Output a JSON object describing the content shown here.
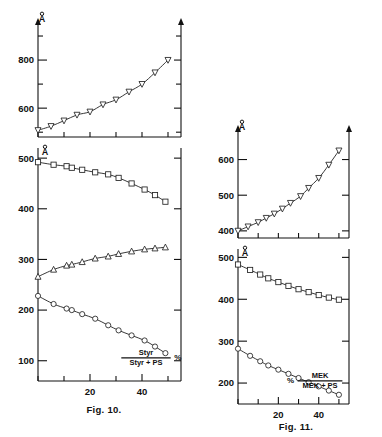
{
  "page": {
    "background": "#ffffff",
    "ink": "#111111"
  },
  "figures": [
    {
      "id": "fig-10",
      "caption": "Fig. 10.",
      "xlabel_numerator": "Styr",
      "xlabel_denominator": "Styr + PS",
      "xlabel_percent": "%",
      "xlabel_percent_side": "right",
      "xaxis_ticks": [
        0,
        10,
        20,
        30,
        40,
        50
      ],
      "xaxis_labeled_ticks": [
        20,
        40
      ],
      "xlim": [
        0,
        55
      ],
      "panels": [
        {
          "id": "fig10-top",
          "ylabel": "Å",
          "yticks": [
            600,
            800
          ],
          "yminor": [
            500,
            700,
            900
          ],
          "ylim": [
            480,
            950
          ]
        },
        {
          "id": "fig10-bottom",
          "ylabel": "Å",
          "yticks": [
            100,
            200,
            300,
            400,
            500
          ],
          "ylim": [
            60,
            520
          ]
        }
      ]
    },
    {
      "id": "fig-11",
      "caption": "Fig. 11.",
      "xlabel_numerator": "MEK",
      "xlabel_denominator": "MEK + PS",
      "xlabel_percent": "%",
      "xlabel_percent_side": "left",
      "xaxis_ticks": [
        0,
        10,
        20,
        30,
        40,
        50
      ],
      "xaxis_labeled_ticks": [
        20,
        40
      ],
      "xlim": [
        0,
        55
      ],
      "panels": [
        {
          "id": "fig11-top",
          "ylabel": "Å",
          "yticks": [
            400,
            500,
            600
          ],
          "ylim": [
            380,
            680
          ]
        },
        {
          "id": "fig11-bottom",
          "ylabel": "Å",
          "yticks": [
            200,
            300,
            400,
            500
          ],
          "ylim": [
            150,
            520
          ]
        }
      ]
    }
  ],
  "chart_data": [
    {
      "id": "fig10-top",
      "type": "scatter",
      "title": "Fig. 10 upper panel",
      "xlabel": "Styr / (Styr + PS)  %",
      "ylabel": "Å",
      "xlim": [
        0,
        55
      ],
      "ylim": [
        480,
        950
      ],
      "grid": false,
      "legend": "none",
      "series": [
        {
          "name": "upper-curve",
          "marker": "triangle-down",
          "x": [
            0,
            5,
            10,
            15,
            20,
            25,
            30,
            35,
            40,
            45,
            50
          ],
          "y": [
            508,
            525,
            548,
            572,
            585,
            615,
            635,
            668,
            700,
            748,
            800
          ]
        }
      ]
    },
    {
      "id": "fig10-bottom",
      "type": "scatter",
      "title": "Fig. 10 lower panel",
      "xlabel": "Styr / (Styr + PS)  %",
      "ylabel": "Å",
      "xlim": [
        0,
        55
      ],
      "ylim": [
        60,
        520
      ],
      "grid": false,
      "legend": "none",
      "series": [
        {
          "name": "square-curve",
          "marker": "square",
          "x": [
            0,
            6,
            11,
            13,
            17,
            22,
            27,
            31,
            36,
            41,
            45,
            49
          ],
          "y": [
            492,
            487,
            484,
            481,
            477,
            472,
            468,
            461,
            450,
            438,
            427,
            414
          ]
        },
        {
          "name": "triangle-curve",
          "marker": "triangle-up",
          "x": [
            0,
            6,
            11,
            13,
            17,
            22,
            27,
            31,
            36,
            41,
            45,
            49
          ],
          "y": [
            266,
            280,
            288,
            290,
            295,
            302,
            306,
            311,
            316,
            320,
            322,
            324
          ]
        },
        {
          "name": "circle-curve",
          "marker": "circle",
          "x": [
            0,
            6,
            11,
            13,
            17,
            22,
            27,
            31,
            36,
            41,
            45,
            49
          ],
          "y": [
            228,
            212,
            203,
            200,
            192,
            183,
            170,
            160,
            150,
            140,
            128,
            115
          ]
        }
      ]
    },
    {
      "id": "fig11-top",
      "type": "scatter",
      "title": "Fig. 11 upper panel",
      "xlabel": "% MEK / (MEK + PS)",
      "ylabel": "Å",
      "xlim": [
        0,
        55
      ],
      "ylim": [
        380,
        680
      ],
      "grid": false,
      "legend": "none",
      "series": [
        {
          "name": "triangle-curve",
          "marker": "triangle-down",
          "x": [
            0,
            5,
            10,
            14,
            18,
            22,
            26,
            31,
            35,
            40,
            45,
            50
          ],
          "y": [
            400,
            412,
            424,
            436,
            448,
            462,
            478,
            497,
            520,
            548,
            585,
            625
          ]
        }
      ]
    },
    {
      "id": "fig11-bottom",
      "type": "scatter",
      "title": "Fig. 11 lower panel",
      "xlabel": "% MEK / (MEK + PS)",
      "ylabel": "Å",
      "xlim": [
        0,
        55
      ],
      "ylim": [
        150,
        520
      ],
      "grid": false,
      "legend": "none",
      "series": [
        {
          "name": "square-curve",
          "marker": "square",
          "x": [
            0,
            6,
            11,
            15,
            20,
            25,
            30,
            35,
            40,
            45,
            50
          ],
          "y": [
            483,
            470,
            459,
            450,
            441,
            432,
            424,
            417,
            410,
            404,
            399
          ]
        },
        {
          "name": "circle-curve",
          "marker": "circle",
          "x": [
            0,
            6,
            11,
            15,
            20,
            25,
            30,
            35,
            40,
            45,
            50
          ],
          "y": [
            282,
            265,
            252,
            242,
            232,
            222,
            212,
            202,
            192,
            182,
            172
          ]
        }
      ]
    }
  ]
}
